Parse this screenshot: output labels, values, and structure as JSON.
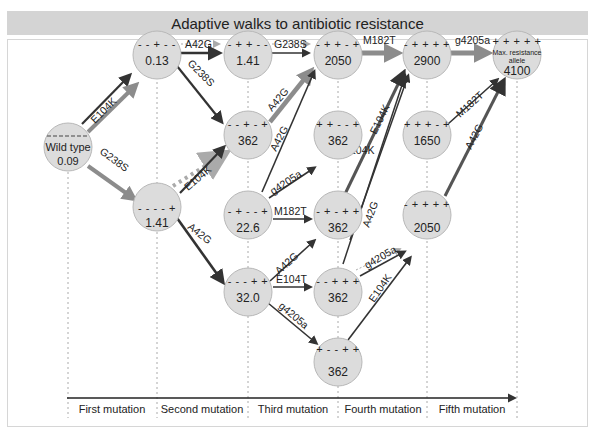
{
  "title": "Adaptive walks to antibiotic resistance",
  "colors": {
    "title_bg": "#d4d4d4",
    "node_fill": "#dcdcdc",
    "node_stroke": "#b8b8b8",
    "arrow_dark": "#333333",
    "arrow_gray": "#8c8c8c",
    "arrow_dotted": "#a8a8a8"
  },
  "nodes": [
    {
      "id": "wt",
      "genotype": "- - - - -",
      "label": "Wild type",
      "value": "0.09"
    },
    {
      "id": "n013",
      "genotype": "- - + - -",
      "value": "0.13"
    },
    {
      "id": "n141b",
      "genotype": "- - - - +",
      "value": "1.41"
    },
    {
      "id": "n141t",
      "genotype": "- + + - -",
      "value": "1.41"
    },
    {
      "id": "n362a",
      "genotype": "- - + - +",
      "value": "362"
    },
    {
      "id": "n226",
      "genotype": "- + - - +",
      "value": "22.6"
    },
    {
      "id": "n320",
      "genotype": "- - - + +",
      "value": "32.0"
    },
    {
      "id": "n2050a",
      "genotype": "- + + - +",
      "value": "2050"
    },
    {
      "id": "n362b",
      "genotype": "+ + - - +",
      "value": "362"
    },
    {
      "id": "n362c",
      "genotype": "- + - + +",
      "value": "362"
    },
    {
      "id": "n362d",
      "genotype": "- - + + +",
      "value": "362"
    },
    {
      "id": "n362e",
      "genotype": "+ - - + +",
      "value": "362"
    },
    {
      "id": "n2900",
      "genotype": "- + + + +",
      "value": "2900"
    },
    {
      "id": "n1650",
      "genotype": "+ + + - +",
      "value": "1650"
    },
    {
      "id": "n2050b",
      "genotype": "- + + + +",
      "value": "2050"
    },
    {
      "id": "max",
      "genotype": "+ + + + +",
      "label_line1": "Max. resistance",
      "label_line2": "allele",
      "value": "4100"
    }
  ],
  "edges": {
    "wt_013": "E104K",
    "wt_141": "G238S",
    "e013_141t": "A42G",
    "e013_362a": "G238S",
    "e141b_362a": "E104K",
    "e141b_320": "A42G",
    "e141t_2050": "G238S",
    "e362a_2050": "A42G",
    "e226_2050": "A42G",
    "e226_362b": "g4205a",
    "e226_362c": "M182T",
    "e320_362c": "A42G",
    "e320_362d": "E104T",
    "e320_362e": "g4205a",
    "e2050_2900": "M182T",
    "e362b_2900": "E104K",
    "e362c_2900": "E104K",
    "e362d_2900": "A42G",
    "e362d_2050b": "g4205a",
    "e362e_2050b": "E104K",
    "e2900_max": "g4205a",
    "e1650_max": "M182T",
    "e2050b_max": "A42G"
  },
  "axis": {
    "labels": [
      "First mutation",
      "Second mutation",
      "Third mutation",
      "Fourth mutation",
      "Fifth mutation"
    ]
  }
}
